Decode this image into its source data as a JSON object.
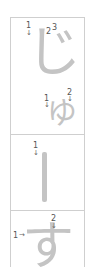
{
  "cards": [
    {
      "glyph": "じ",
      "labels": [
        {
          "num": "1",
          "arrow": "↓"
        },
        {
          "num": "2",
          "arrow": ""
        },
        {
          "num": "3",
          "arrow": ""
        }
      ],
      "sub_glyph": "ゆ",
      "sub_labels": [
        {
          "num": "1",
          "arrow": "↓"
        },
        {
          "num": "2",
          "arrow": "↓"
        }
      ]
    },
    {
      "glyph": "ー",
      "labels": [
        {
          "num": "1",
          "arrow": "↓"
        }
      ]
    },
    {
      "glyph": "す",
      "labels": [
        {
          "num": "1",
          "arrow": "→"
        },
        {
          "num": "2",
          "arrow": "↓"
        }
      ]
    }
  ],
  "colors": {
    "glyph": "#c4c4c4",
    "border": "#cfcfcf",
    "label": "#555555"
  }
}
